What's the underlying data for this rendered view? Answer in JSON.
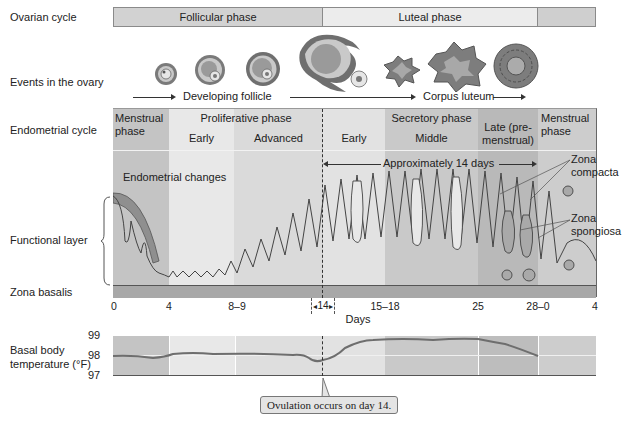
{
  "rows": {
    "ovarian_cycle": "Ovarian cycle",
    "events_in_ovary": "Events in the ovary",
    "endometrial_cycle": "Endometrial cycle",
    "functional_layer": "Functional layer",
    "zona_basalis": "Zona basalis",
    "basal_body_temp_line1": "Basal body",
    "basal_body_temp_line2": "temperature (°F)"
  },
  "ovarian_phases": {
    "follicular": "Follicular phase",
    "luteal": "Luteal phase"
  },
  "ovary_events": {
    "developing_follicle": "Developing follicle",
    "corpus_luteum": "Corpus luteum"
  },
  "endometrial_phases": {
    "menstrual_start": "Menstrual phase",
    "proliferative": "Proliferative phase",
    "prolif_early": "Early",
    "prolif_advanced": "Advanced",
    "secretory": "Secretory phase",
    "secr_early": "Early",
    "secr_middle": "Middle",
    "secr_late_line1": "Late (pre-",
    "secr_late_line2": "menstrual)",
    "menstrual_end": "Menstrual phase"
  },
  "annotations": {
    "endometrial_changes": "Endometrial changes",
    "approx_14_days": "Approximately 14 days",
    "zona_compacta_line1": "Zona",
    "zona_compacta_line2": "compacta",
    "zona_spongiosa_line1": "Zona",
    "zona_spongiosa_line2": "spongiosa",
    "ovulation": "Ovulation occurs on day 14."
  },
  "days_axis": {
    "label": "Days",
    "ticks": [
      "0",
      "4",
      "8–9",
      "14",
      "15–18",
      "25",
      "28–0",
      "4"
    ]
  },
  "temperature_axis": {
    "ticks": [
      "99",
      "98",
      "97"
    ]
  },
  "colors": {
    "menstrual": "#c4c4c4",
    "prolif_early": "#e8e8e8",
    "prolif_advanced": "#dadada",
    "secr_early": "#e2e2e2",
    "secr_middle": "#c9c9c9",
    "secr_late": "#b9b9b9",
    "basalis": "#a8a8a8",
    "temp_line": "#6e6e6e"
  }
}
